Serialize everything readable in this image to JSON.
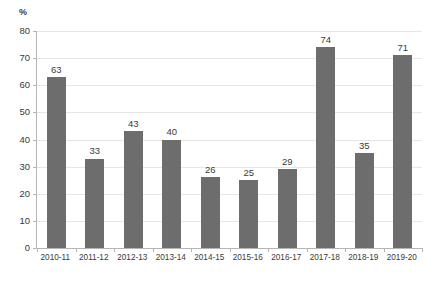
{
  "chart_data": {
    "type": "bar",
    "title": "",
    "subtitle": "",
    "xlabel": "",
    "ylabel": "%",
    "unit_label": "%",
    "categories": [
      "2010-11",
      "2011-12",
      "2012-13",
      "2013-14",
      "2014-15",
      "2015-16",
      "2016-17",
      "2017-18",
      "2018-19",
      "2019-20"
    ],
    "values": [
      63,
      33,
      43,
      40,
      26,
      25,
      29,
      74,
      35,
      71
    ],
    "data_labels": [
      "63",
      "33",
      "43",
      "40",
      "26",
      "25",
      "29",
      "74",
      "35",
      "71"
    ],
    "ylim": [
      0,
      80
    ],
    "y_ticks": [
      0,
      10,
      20,
      30,
      40,
      50,
      60,
      70,
      80
    ],
    "y_tick_labels": [
      "0",
      "10",
      "20",
      "30",
      "40",
      "50",
      "60",
      "70",
      "80"
    ],
    "grid": true,
    "grid_axis": "y",
    "legend": false,
    "legend_position": "none",
    "bar_color": "#6d6d6d",
    "gridline_color": "#e6e6e6",
    "axis_color": "#b5b5b5",
    "text_color": "#3a3a3a",
    "background_color": "#ffffff"
  },
  "caption": {
    "clipped_text": ""
  }
}
